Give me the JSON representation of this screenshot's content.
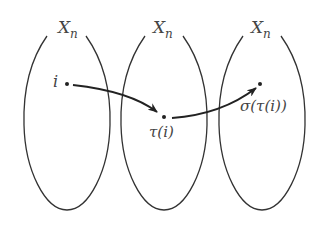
{
  "diagram": {
    "sets": [
      {
        "label": "X",
        "subscript": "n"
      },
      {
        "label": "X",
        "subscript": "n"
      },
      {
        "label": "X",
        "subscript": "n"
      }
    ],
    "points": [
      {
        "label": "i"
      },
      {
        "label": "τ(i)"
      },
      {
        "label": "σ(τ(i))"
      }
    ],
    "arrows": [
      {
        "from": "i",
        "to": "τ(i)"
      },
      {
        "from": "τ(i)",
        "to": "σ(τ(i))"
      }
    ],
    "colors": {
      "stroke": "#333333",
      "text": "#444444"
    }
  }
}
